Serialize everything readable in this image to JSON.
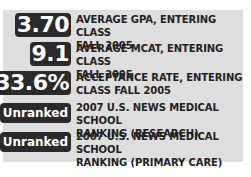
{
  "stats": [
    {
      "value": "3.70",
      "label_line1": "AVERAGE GPA, ENTERING CLASS",
      "label_line2": "FALL 2005"
    },
    {
      "value": "9.1",
      "label_line1": "AVERAGE MCAT, ENTERING CLASS",
      "label_line2": "FALL 2005"
    },
    {
      "value": "33.6%",
      "label_line1": "ACCEPTANCE RATE, ENTERING",
      "label_line2": "CLASS FALL 2005"
    },
    {
      "value": "Unranked",
      "label_line1": "2007 U.S. NEWS MEDICAL SCHOOL",
      "label_line2": "RANKING (RESEARCH)"
    },
    {
      "value": "Unranked",
      "label_line1": "2007 U.S. NEWS MEDICAL SCHOOL",
      "label_line2": "RANKING (PRIMARY CARE)"
    }
  ],
  "colors": {
    "panel_bg": "#dedede",
    "badge_bg": "#2a2a2a",
    "badge_text": "#ffffff",
    "label_text": "#222222"
  }
}
